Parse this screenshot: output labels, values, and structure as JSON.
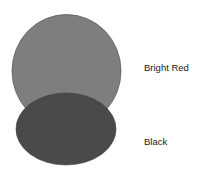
{
  "diagram": {
    "shapes": [
      {
        "id": "bright-red-region",
        "label": "Bright Red",
        "fill": "#7e7e7e",
        "stroke": "#5e5e5e"
      },
      {
        "id": "black-region",
        "label": "Black",
        "fill": "#4a4a4a",
        "stroke": "#3c3c3c"
      }
    ],
    "labels": {
      "bright_red": "Bright Red",
      "black": "Black"
    }
  }
}
